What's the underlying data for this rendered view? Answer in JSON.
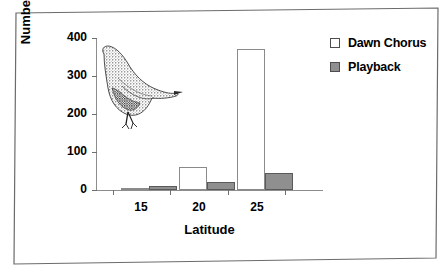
{
  "chart_data": {
    "type": "bar",
    "title": "",
    "subtitle": "",
    "xlabel": "Latitude",
    "ylabel": "Number of Songs",
    "categories": [
      "15",
      "20",
      "25"
    ],
    "series": [
      {
        "name": "Dawn Chorus",
        "color": "#ffffff",
        "values": [
          6,
          60,
          370
        ]
      },
      {
        "name": "Playback",
        "color": "#8f8f8f",
        "values": [
          11,
          20,
          45
        ]
      }
    ],
    "ylim": [
      0,
      400
    ],
    "yticks": [
      0,
      100,
      200,
      300,
      400
    ],
    "ytick_labels": [
      "0",
      "100",
      "200",
      "300",
      "400"
    ],
    "xtick_labels": [
      "15",
      "20",
      "25"
    ],
    "grid": false,
    "legend_position": "right",
    "annotations": [
      {
        "name": "bird-illustration",
        "description": "stippled ink drawing of a perched wren"
      }
    ]
  },
  "legend": {
    "items": [
      {
        "label": "Dawn Chorus",
        "swatch": "open-square-icon"
      },
      {
        "label": "Playback",
        "swatch": "filled-square-icon"
      }
    ]
  },
  "axes": {
    "y_title": "Number of Songs",
    "x_title": "Latitude"
  }
}
